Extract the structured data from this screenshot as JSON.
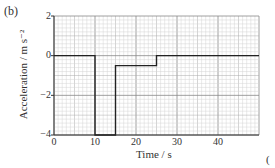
{
  "figure": {
    "part_label": "(b)",
    "marks_label": "(",
    "ylabel": "Acceleration / m s⁻²",
    "xlabel": "Time / s"
  },
  "axes": {
    "yticks": [
      "2",
      "0",
      "−2",
      "−4"
    ],
    "xticks": [
      "0",
      "10",
      "20",
      "30",
      "40"
    ]
  },
  "chart_data": {
    "type": "line",
    "title": "",
    "xlabel": "Time / s",
    "ylabel": "Acceleration / m s^-2",
    "xlim": [
      0,
      50
    ],
    "ylim": [
      -4,
      2
    ],
    "grid": true,
    "x_ticks": [
      0,
      10,
      20,
      30,
      40
    ],
    "y_ticks": [
      2,
      0,
      -2,
      -4
    ],
    "series": [
      {
        "name": "acceleration",
        "style": "step",
        "x": [
          0,
          10,
          10,
          15,
          15,
          25,
          25,
          50
        ],
        "y": [
          0,
          0,
          -4,
          -4,
          -0.5,
          -0.5,
          0,
          0
        ]
      }
    ]
  }
}
